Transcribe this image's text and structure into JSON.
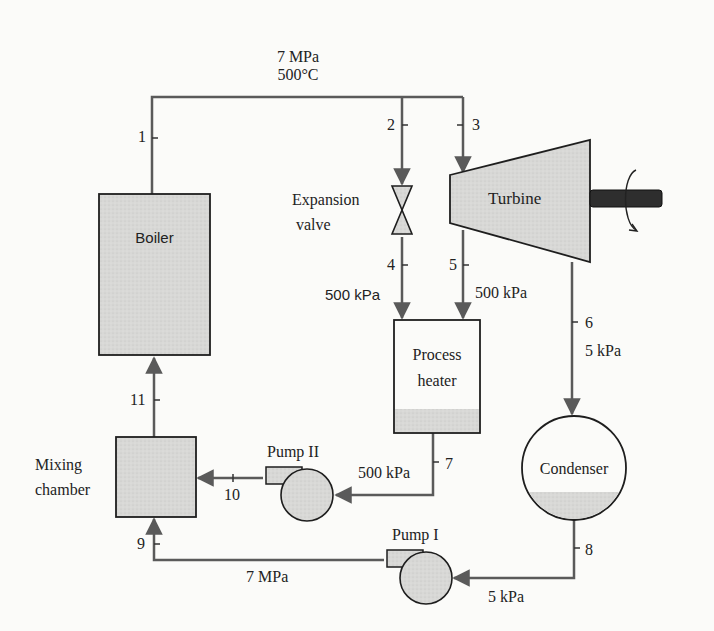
{
  "components": {
    "boiler": "Boiler",
    "expansion_valve_line1": "Expansion",
    "expansion_valve_line2": "valve",
    "turbine": "Turbine",
    "process_heater_line1": "Process",
    "process_heater_line2": "heater",
    "condenser": "Condenser",
    "mixing_chamber_line1": "Mixing",
    "mixing_chamber_line2": "chamber",
    "pump1": "Pump I",
    "pump2": "Pump II"
  },
  "states": {
    "s1": "1",
    "s2": "2",
    "s3": "3",
    "s4": "4",
    "s5": "5",
    "s6": "6",
    "s7": "7",
    "s8": "8",
    "s9": "9",
    "s10": "10",
    "s11": "11"
  },
  "conditions": {
    "boiler_exit_pressure": "7 MPa",
    "boiler_exit_temperature": "500°C",
    "state4_pressure": "500 kPa",
    "state5_pressure": "500 kPa",
    "state6_pressure": "5 kPa",
    "state7_pressure": "500 kPa",
    "state8_pressure": "5 kPa",
    "state9_pressure": "7 MPa"
  },
  "colors": {
    "line": "#5a5a5a",
    "fill": "#d6d6d6",
    "outline": "#1e1e1e",
    "shaft": "#2a2a2a"
  }
}
